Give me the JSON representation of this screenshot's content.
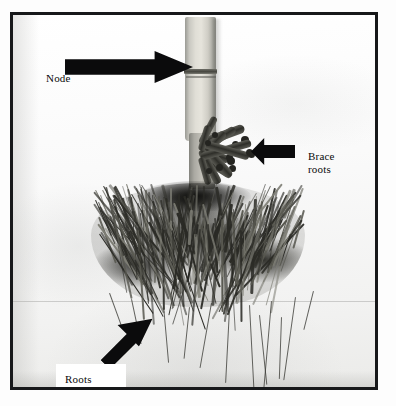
{
  "figure": {
    "kind": "annotated-photograph",
    "rendering": "black and white photograph with black border",
    "annotations": [
      {
        "id": "node",
        "label": "Node",
        "arrow_direction": "right",
        "points_to": "stalk node band on the lower stem"
      },
      {
        "id": "brace-roots",
        "label": "Brace\nroots",
        "label_line_1": "Brace",
        "label_line_2": "roots",
        "arrow_direction": "left",
        "points_to": "thick aerial prop roots emerging from the stalk"
      },
      {
        "id": "roots",
        "label": "Roots",
        "arrow_direction": "diagonal-up-right",
        "points_to": "dense fibrous root mass"
      }
    ]
  },
  "colors": {
    "frame": "#17181a",
    "arrow": "#0b0b0c",
    "label_text": "#0a0a0b",
    "photo_background": "#fbfbfa",
    "page_background": "#ffffff",
    "stalk_light": "#e6e4dc",
    "root_dark": "#2b2b26"
  }
}
